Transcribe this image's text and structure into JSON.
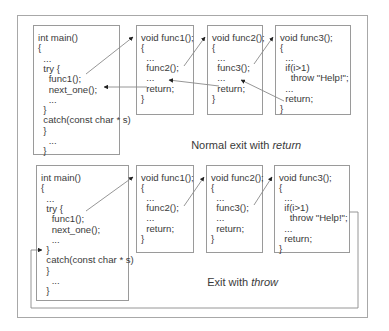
{
  "normal": {
    "caption_prefix": "Normal exit with ",
    "caption_em": "return",
    "main": [
      "int main()",
      "{",
      "  ...",
      "  try {",
      "    func1();",
      "    next_one();",
      "    ...",
      "  }",
      "  catch(const char * s)",
      "  }",
      "    ...",
      "  }"
    ],
    "func1": [
      "void func1();",
      "{",
      "  ...",
      "  func2();",
      "  ...",
      "  return;",
      "}"
    ],
    "func2": [
      "void func2();",
      "{",
      "  ...",
      "  func3();",
      "  ...",
      "  return;",
      "}"
    ],
    "func3": [
      "void func3();",
      "{",
      "  ...",
      "  if(i>1)",
      "    throw \"Help!\";",
      "  ...",
      "  return;",
      "}"
    ]
  },
  "throw": {
    "caption_prefix": "Exit with ",
    "caption_em": "throw",
    "main": [
      "int main()",
      "{",
      "  ...",
      "  try {",
      "    func1();",
      "    next_one();",
      "    ...",
      "  }",
      "  catch(const char * s)",
      "  }",
      "    ...",
      "  }"
    ],
    "func1": [
      "void func1();",
      "{",
      "  ...",
      "  func2();",
      "  ...",
      "  return;",
      "}"
    ],
    "func2": [
      "void func2();",
      "{",
      "  ...",
      "  func3();",
      "  ...",
      "  return;",
      "}"
    ],
    "func3": [
      "void func3();",
      "{",
      "  ...",
      "  if(i>1)",
      "    throw \"Help!\";",
      "  ...",
      "  return;",
      "}"
    ]
  },
  "colors": {
    "line": "#8a8a8a",
    "arrowhead": "#222222",
    "text": "#3a3a3a",
    "border": "#9a9a9a"
  }
}
